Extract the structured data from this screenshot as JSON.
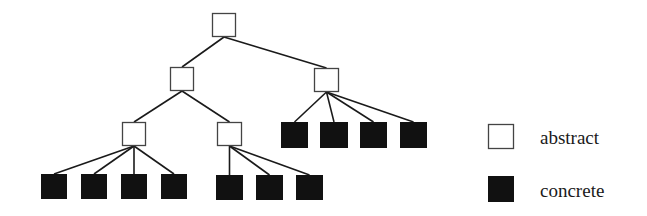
{
  "diagram": {
    "type": "tree",
    "colors": {
      "background": "#ffffff",
      "stroke": "#1a1a1a",
      "abstract_fill": "#ffffff",
      "concrete_fill": "#111111"
    },
    "nodes": [
      {
        "id": "root",
        "kind": "abstract",
        "x": 212,
        "y": 13,
        "w": 24,
        "h": 24
      },
      {
        "id": "n-left",
        "kind": "abstract",
        "x": 170,
        "y": 67,
        "w": 24,
        "h": 24
      },
      {
        "id": "n-right",
        "kind": "abstract",
        "x": 314,
        "y": 68,
        "w": 25,
        "h": 24
      },
      {
        "id": "n-left-left",
        "kind": "abstract",
        "x": 122,
        "y": 122,
        "w": 24,
        "h": 24
      },
      {
        "id": "n-left-right",
        "kind": "abstract",
        "x": 217,
        "y": 122,
        "w": 25,
        "h": 24
      },
      {
        "id": "leaf-1",
        "kind": "concrete",
        "x": 41,
        "y": 174,
        "w": 26,
        "h": 25
      },
      {
        "id": "leaf-2",
        "kind": "concrete",
        "x": 81,
        "y": 174,
        "w": 26,
        "h": 25
      },
      {
        "id": "leaf-3",
        "kind": "concrete",
        "x": 121,
        "y": 174,
        "w": 26,
        "h": 25
      },
      {
        "id": "leaf-4",
        "kind": "concrete",
        "x": 161,
        "y": 174,
        "w": 26,
        "h": 25
      },
      {
        "id": "leaf-5",
        "kind": "concrete",
        "x": 216,
        "y": 175,
        "w": 27,
        "h": 25
      },
      {
        "id": "leaf-6",
        "kind": "concrete",
        "x": 256,
        "y": 175,
        "w": 27,
        "h": 25
      },
      {
        "id": "leaf-7",
        "kind": "concrete",
        "x": 296,
        "y": 175,
        "w": 27,
        "h": 25
      },
      {
        "id": "leaf-8",
        "kind": "concrete",
        "x": 281,
        "y": 122,
        "w": 27,
        "h": 26
      },
      {
        "id": "leaf-9",
        "kind": "concrete",
        "x": 320,
        "y": 122,
        "w": 28,
        "h": 26
      },
      {
        "id": "leaf-10",
        "kind": "concrete",
        "x": 360,
        "y": 122,
        "w": 27,
        "h": 26
      },
      {
        "id": "leaf-11",
        "kind": "concrete",
        "x": 400,
        "y": 122,
        "w": 27,
        "h": 26
      }
    ],
    "edges": [
      [
        "root",
        "n-left"
      ],
      [
        "root",
        "n-right"
      ],
      [
        "n-left",
        "n-left-left"
      ],
      [
        "n-left",
        "n-left-right"
      ],
      [
        "n-left-left",
        "leaf-1"
      ],
      [
        "n-left-left",
        "leaf-2"
      ],
      [
        "n-left-left",
        "leaf-3"
      ],
      [
        "n-left-left",
        "leaf-4"
      ],
      [
        "n-left-right",
        "leaf-5"
      ],
      [
        "n-left-right",
        "leaf-6"
      ],
      [
        "n-left-right",
        "leaf-7"
      ],
      [
        "n-right",
        "leaf-8"
      ],
      [
        "n-right",
        "leaf-9"
      ],
      [
        "n-right",
        "leaf-10"
      ],
      [
        "n-right",
        "leaf-11"
      ]
    ]
  },
  "legend": {
    "items": [
      {
        "kind": "abstract",
        "label": "abstract",
        "box": {
          "x": 488,
          "y": 124,
          "w": 26,
          "h": 25
        },
        "text_x": 540,
        "text_y": 128
      },
      {
        "kind": "concrete",
        "label": "concrete",
        "box": {
          "x": 488,
          "y": 176,
          "w": 26,
          "h": 26
        },
        "text_x": 540,
        "text_y": 181
      }
    ]
  }
}
